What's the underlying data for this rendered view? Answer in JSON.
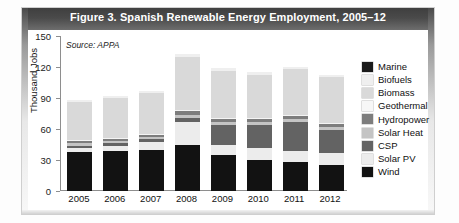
{
  "figure": {
    "title": "Figure 3. Spanish Renewable Energy Employment, 2005–12",
    "source_note": "Source: APPA"
  },
  "chart_data": {
    "type": "bar",
    "stacked": true,
    "title": "Figure 3. Spanish Renewable Energy Employment, 2005–12",
    "xlabel": "",
    "ylabel": "Thousand Jobs",
    "ylim": [
      0,
      150
    ],
    "yticks": [
      0,
      30,
      60,
      90,
      120,
      150
    ],
    "ytick_labels": [
      "0",
      "30",
      "60",
      "90",
      "120",
      "150"
    ],
    "grid": false,
    "legend_position": "right",
    "categories": [
      "2005",
      "2006",
      "2007",
      "2008",
      "2009",
      "2010",
      "2011",
      "2012"
    ],
    "series": [
      {
        "name": "Wind",
        "color": "#121212",
        "values": [
          38,
          39,
          40,
          45,
          35,
          30,
          28,
          25
        ]
      },
      {
        "name": "Solar PV",
        "color": "#ececec",
        "values": [
          4,
          5,
          7,
          22,
          10,
          12,
          11,
          12
        ]
      },
      {
        "name": "CSP",
        "color": "#636363",
        "values": [
          2,
          2,
          3,
          4,
          19,
          22,
          28,
          22
        ]
      },
      {
        "name": "Solar Heat",
        "color": "#c4c4c4",
        "values": [
          2,
          2,
          2,
          3,
          3,
          3,
          3,
          3
        ]
      },
      {
        "name": "Hydropower",
        "color": "#7d7d7d",
        "values": [
          2,
          2,
          2,
          3,
          3,
          3,
          3,
          3
        ]
      },
      {
        "name": "Geothermal",
        "color": "#f4f4f4",
        "values": [
          1,
          1,
          1,
          1,
          1,
          1,
          1,
          1
        ]
      },
      {
        "name": "Biomass",
        "color": "#d9d9d9",
        "values": [
          37,
          39,
          40,
          52,
          45,
          41,
          44,
          44
        ]
      },
      {
        "name": "Biofuels",
        "color": "#efefef",
        "values": [
          2,
          2,
          2,
          3,
          3,
          3,
          2,
          2
        ]
      },
      {
        "name": "Marine",
        "color": "#1a1a1a",
        "values": [
          0,
          0,
          0,
          0,
          0,
          0,
          0,
          0
        ]
      }
    ],
    "totals": [
      88,
      92,
      97,
      133,
      119,
      115,
      120,
      112
    ]
  },
  "legend": {
    "items": [
      {
        "label": "Marine",
        "color": "#1a1a1a"
      },
      {
        "label": "Biofuels",
        "color": "#efefef"
      },
      {
        "label": "Biomass",
        "color": "#d9d9d9"
      },
      {
        "label": "Geothermal",
        "color": "#f7f7f7"
      },
      {
        "label": "Hydropower",
        "color": "#7d7d7d"
      },
      {
        "label": "Solar Heat",
        "color": "#c4c4c4"
      },
      {
        "label": "CSP",
        "color": "#636363"
      },
      {
        "label": "Solar PV",
        "color": "#ececec"
      },
      {
        "label": "Wind",
        "color": "#121212"
      }
    ]
  }
}
